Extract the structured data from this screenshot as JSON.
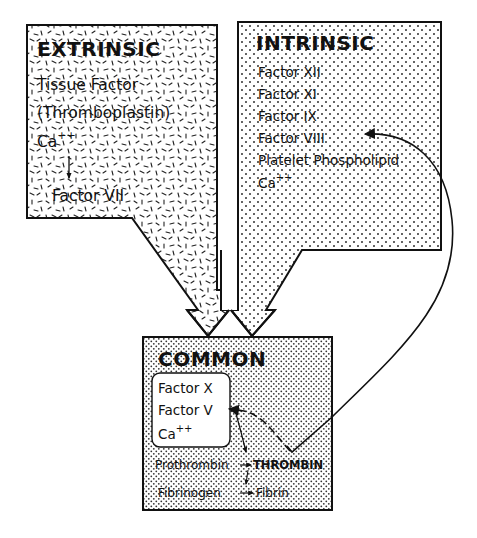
{
  "diagram": {
    "type": "coagulation-cascade",
    "colors": {
      "ink": "#111111",
      "background": "#ffffff",
      "extrinsic_pattern": "dashes",
      "intrinsic_pattern": "dots",
      "common_pattern": "dense-dots"
    },
    "extrinsic": {
      "title": "EXTRINSIC",
      "items": [
        "Tissue Factor",
        "(Thromboplastin)",
        "Ca",
        "Factor VII"
      ],
      "ca_superscript": "++",
      "arrow": "down-arrow from Ca++ to Factor VII"
    },
    "intrinsic": {
      "title": "INTRINSIC",
      "items": [
        "Factor XII",
        "Factor XI",
        "Factor IX",
        "Factor VIII",
        "Platelet Phospholipid",
        "Ca"
      ],
      "ca_superscript": "++"
    },
    "common": {
      "title": "COMMON",
      "inner_box": {
        "items": [
          "Factor X",
          "Factor V",
          "Ca"
        ],
        "ca_superscript": "++"
      },
      "reactions": [
        {
          "from": "Prothrombin",
          "to": "THROMBIN"
        },
        {
          "from": "Fibrinogen",
          "to": "Fibrin"
        }
      ]
    },
    "connections": [
      {
        "from": "extrinsic",
        "to": "common",
        "style": "big-arrow"
      },
      {
        "from": "intrinsic",
        "to": "common",
        "style": "big-arrow"
      },
      {
        "from": "THROMBIN",
        "to": "Factor V",
        "style": "dashed-feedback-arrow"
      },
      {
        "from": "THROMBIN",
        "to": "Factor VIII",
        "style": "curved-feedback-arrow"
      },
      {
        "from": "Factor V",
        "to": "Prothrombin",
        "style": "thin-arrow"
      },
      {
        "from": "THROMBIN",
        "to": "Fibrinogen",
        "style": "thin-arrow"
      }
    ]
  }
}
